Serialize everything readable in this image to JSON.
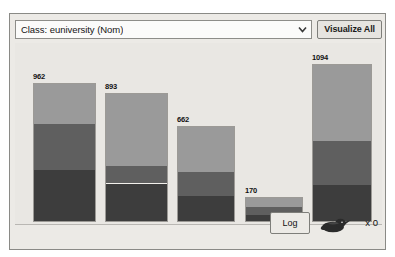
{
  "panel": {
    "class_selector": {
      "value": "Class: euniversity (Nom)",
      "dropdown_icon": "chevron-down-icon"
    },
    "visualize_all_label": "Visualize All"
  },
  "status": {
    "log_label": "Log",
    "bird_icon": "weka-bird-icon",
    "task_count_label": "x 0"
  },
  "chart_data": {
    "type": "bar",
    "stacked": true,
    "title": "",
    "xlabel": "",
    "ylabel": "",
    "grid": false,
    "legend": "none",
    "ylim": [
      0,
      1094
    ],
    "categories": [
      "bin1",
      "bin2",
      "bin3",
      "bin4",
      "bin5"
    ],
    "totals": [
      962,
      893,
      662,
      170,
      1094
    ],
    "data_labels": [
      "962",
      "893",
      "662",
      "170",
      "1094"
    ],
    "series": [
      {
        "name": "class-a",
        "color": "#3d3d3d",
        "values": [
          355,
          270,
          180,
          48,
          250
        ]
      },
      {
        "name": "class-b",
        "color": "#5f5f5f",
        "values": [
          330,
          120,
          170,
          58,
          310
        ]
      },
      {
        "name": "class-c",
        "color": "#9a9a9a",
        "values": [
          277,
          503,
          312,
          64,
          534
        ]
      }
    ],
    "colors": {
      "segment_bottom": "#3d3d3d",
      "segment_middle": "#5f5f5f",
      "segment_top": "#9a9a9a",
      "plot_background": "#e9e7e3"
    }
  }
}
